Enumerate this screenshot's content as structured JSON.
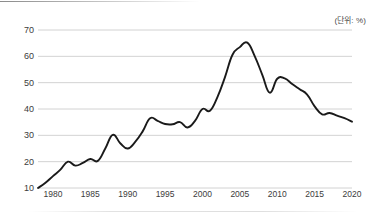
{
  "annotations": {
    "unit_note": "(단위: %)"
  },
  "chart_data": {
    "type": "line",
    "title": "",
    "subtitle": "",
    "xlabel": "",
    "ylabel": "",
    "unit": "%",
    "unit_note": "(단위: %)",
    "grid": "horizontal",
    "legend": "none",
    "xlim": [
      1978,
      2020
    ],
    "ylim": [
      10,
      70
    ],
    "ytick_values": [
      10,
      20,
      30,
      40,
      50,
      60,
      70
    ],
    "ytick_labels": [
      "10",
      "20",
      "30",
      "40",
      "50",
      "60",
      "70"
    ],
    "xtick_values": [
      1980,
      1985,
      1990,
      1995,
      2000,
      2005,
      2010,
      2015,
      2020
    ],
    "xtick_labels": [
      "1980",
      "1985",
      "1990",
      "1995",
      "2000",
      "2005",
      "2010",
      "2015",
      "2020"
    ],
    "line_color": "#1a1a1a",
    "grid_color": "#c6c6c6",
    "series": [
      {
        "name": "",
        "x": [
          1978,
          1979,
          1980,
          1981,
          1982,
          1983,
          1984,
          1985,
          1986,
          1987,
          1988,
          1989,
          1990,
          1991,
          1992,
          1993,
          1994,
          1995,
          1996,
          1997,
          1998,
          1999,
          2000,
          2001,
          2002,
          2003,
          2004,
          2005,
          2006,
          2007,
          2008,
          2009,
          2010,
          2011,
          2012,
          2013,
          2014,
          2015,
          2016,
          2017,
          2018,
          2019,
          2020
        ],
        "values": [
          10.0,
          12.0,
          14.5,
          17.0,
          20.0,
          18.5,
          19.5,
          21.0,
          20.3,
          25.0,
          30.2,
          27.0,
          25.0,
          27.5,
          31.5,
          36.5,
          35.5,
          34.3,
          34.2,
          35.0,
          33.0,
          35.5,
          40.0,
          39.3,
          44.5,
          52.0,
          60.5,
          63.5,
          65.2,
          60.0,
          53.0,
          46.2,
          51.5,
          51.6,
          49.5,
          47.5,
          45.5,
          41.0,
          38.0,
          38.5,
          37.5,
          36.5,
          35.2
        ]
      }
    ]
  }
}
